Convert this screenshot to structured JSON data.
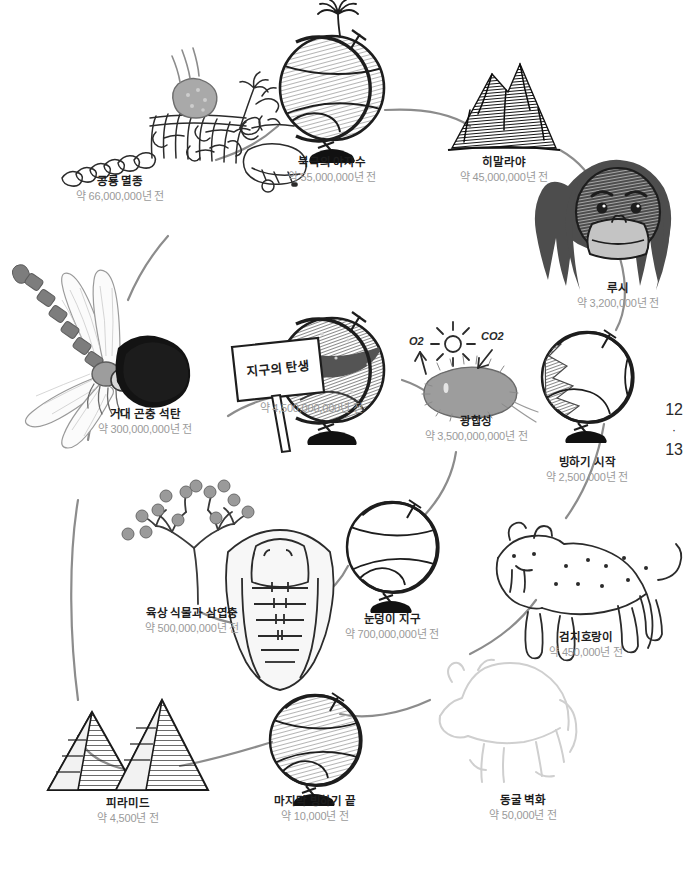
{
  "page": {
    "folio_left": "12",
    "folio_separator": "·",
    "folio_right": "13"
  },
  "sign": {
    "text": "지구의 탄생"
  },
  "gas_labels": {
    "oxygen": "O2",
    "carbon_dioxide": "CO2"
  },
  "colors": {
    "ink": "#1d1d1d",
    "date_gray": "#9a9a9a",
    "path_gray": "#8c8c8c",
    "globe_fill": "#a8a8a8",
    "globe_dark": "#6e6e6e",
    "coal_black": "#1a1a1a",
    "mountain_black": "#121212",
    "cave_outline": "#cfcfcf",
    "base_black": "#111111"
  },
  "timeline": [
    {
      "id": "dinosaur-extinction",
      "title": "공룡 멸종",
      "date": "약 66,000,000년 전",
      "icon": "dinosaur-skeleton-icon"
    },
    {
      "id": "arctic-palm",
      "title": "북극의 야자수",
      "date": "약 55,000,000년 전",
      "icon": "globe-palm-icon"
    },
    {
      "id": "himalaya",
      "title": "히말라야",
      "date": "약 45,000,000년 전",
      "icon": "mountain-icon"
    },
    {
      "id": "lucy",
      "title": "루시",
      "date": "약 3,200,000년 전",
      "icon": "hominid-face-icon"
    },
    {
      "id": "ice-age-start",
      "title": "빙하기 시작",
      "date": "약 2,500,000년 전",
      "icon": "globe-ice-icon"
    },
    {
      "id": "saber-tooth-tiger",
      "title": "검치호랑이",
      "date": "약 450,000년 전",
      "icon": "saber-tooth-tiger-icon"
    },
    {
      "id": "cave-painting",
      "title": "동굴 벽화",
      "date": "약 50,000년 전",
      "icon": "bison-outline-icon"
    },
    {
      "id": "last-ice-age-end",
      "title": "마지막 빙하기 끝",
      "date": "약 10,000년 전",
      "icon": "globe-icon"
    },
    {
      "id": "pyramid",
      "title": "피라미드",
      "date": "약 4,500년 전",
      "icon": "pyramid-icon"
    },
    {
      "id": "land-plants-trilobite",
      "title": "육상 식물과 삼엽충",
      "date": "약 500,000,000년 전",
      "icon": "plant-trilobite-icon"
    },
    {
      "id": "snowball-earth",
      "title": "눈덩이 지구",
      "date": "약 700,000,000년 전",
      "icon": "globe-snowball-icon"
    },
    {
      "id": "giant-insect-coal",
      "title": "거대 곤충 석탄",
      "date": "약 300,000,000년 전",
      "icon": "dragonfly-coal-icon"
    },
    {
      "id": "photosynthesis",
      "title": "광합성",
      "date": "약 3,500,000,000년 전",
      "icon": "cyanobacteria-icon"
    },
    {
      "id": "earth-birth",
      "title": "지구의 탄생",
      "date": "약 4,500,000,000년 전",
      "icon": "globe-molten-icon"
    }
  ]
}
